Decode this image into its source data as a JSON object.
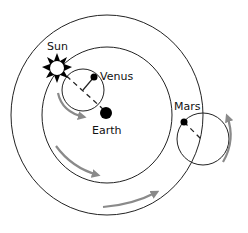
{
  "diagram": {
    "colors": {
      "line": "#222222",
      "arrow": "#8a8a8a",
      "body": "#000000",
      "background": "#ffffff"
    },
    "labels": {
      "sun": "Sun",
      "venus": "Venus",
      "earth": "Earth",
      "mars": "Mars"
    },
    "orbits": [
      {
        "name": "outer-deferent",
        "cx": 107,
        "cy": 115,
        "rx": 96,
        "ry": 100
      },
      {
        "name": "inner-deferent",
        "cx": 107,
        "cy": 115,
        "rx": 65,
        "ry": 68
      }
    ],
    "epicycles": [
      {
        "name": "venus-epicycle",
        "cx": 83,
        "cy": 90,
        "r": 21
      },
      {
        "name": "mars-epicycle",
        "cx": 203,
        "cy": 139,
        "r": 26
      }
    ]
  }
}
